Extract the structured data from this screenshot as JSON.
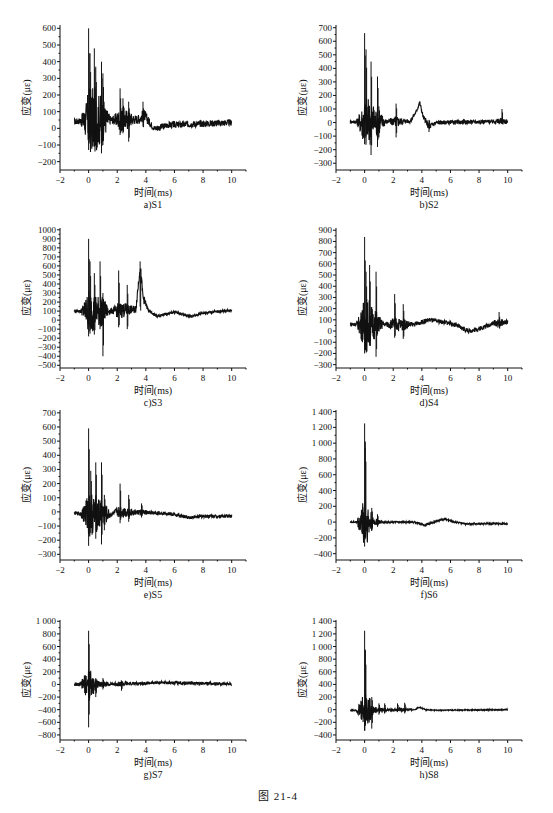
{
  "figure": {
    "title": "图   21-4"
  },
  "chart_data": [
    {
      "id": "a",
      "type": "line",
      "caption": "a)S1",
      "xlabel": "时间(ms)",
      "ylabel": "应变(με)",
      "xlim": [
        -2,
        11
      ],
      "xticks": [
        -2,
        0,
        2,
        4,
        6,
        8,
        10
      ],
      "ylim": [
        -250,
        620
      ],
      "yticks": [
        600,
        500,
        400,
        300,
        200,
        100,
        0,
        -100,
        -200
      ],
      "ytick_labels": [
        "600",
        "500",
        "400",
        "300",
        "200",
        "100",
        "0",
        "-100",
        "-200"
      ],
      "x_range": [
        -1,
        10
      ],
      "baseline_points": [
        [
          -1,
          40
        ],
        [
          0,
          50
        ],
        [
          1,
          50
        ],
        [
          3.5,
          55
        ],
        [
          3.9,
          80
        ],
        [
          4.3,
          30
        ],
        [
          4.6,
          0
        ],
        [
          5.0,
          5
        ],
        [
          5.5,
          20
        ],
        [
          10,
          35
        ]
      ],
      "noise": 20,
      "spikes": [
        [
          0.0,
          600,
          -130
        ],
        [
          0.1,
          450,
          -80
        ],
        [
          0.4,
          480,
          -110
        ],
        [
          0.5,
          370,
          -60
        ],
        [
          0.9,
          400,
          -150
        ],
        [
          1.0,
          330,
          -100
        ],
        [
          2.2,
          240,
          -40
        ],
        [
          2.4,
          180,
          -30
        ],
        [
          2.8,
          160,
          -80
        ],
        [
          3.8,
          160,
          10
        ]
      ],
      "box": {
        "left": 20,
        "top": 15,
        "width": 240,
        "height": 195
      },
      "grid": false
    },
    {
      "id": "b",
      "type": "line",
      "caption": "b)S2",
      "xlabel": "时间(ms)",
      "ylabel": "应变(με)",
      "xlim": [
        -2,
        11
      ],
      "xticks": [
        -2,
        0,
        2,
        4,
        6,
        8,
        10
      ],
      "ylim": [
        -350,
        720
      ],
      "yticks": [
        700,
        600,
        500,
        400,
        300,
        200,
        100,
        0,
        -100,
        -200,
        -300
      ],
      "ytick_labels": [
        "700",
        "600",
        "500",
        "400",
        "300",
        "200",
        "100",
        "0",
        "-100",
        "-200",
        "-300"
      ],
      "x_range": [
        -1,
        10
      ],
      "baseline_points": [
        [
          -1,
          5
        ],
        [
          3.2,
          10
        ],
        [
          3.6,
          80
        ],
        [
          3.85,
          150
        ],
        [
          4.1,
          40
        ],
        [
          4.5,
          -30
        ],
        [
          5.0,
          0
        ],
        [
          10,
          10
        ]
      ],
      "noise": 15,
      "spikes": [
        [
          0.0,
          660,
          -160
        ],
        [
          0.1,
          540,
          -100
        ],
        [
          0.45,
          450,
          -240
        ],
        [
          0.9,
          340,
          -180
        ],
        [
          1.0,
          120,
          -110
        ],
        [
          2.2,
          140,
          -110
        ],
        [
          4.5,
          20,
          -70
        ],
        [
          9.6,
          100,
          -10
        ]
      ],
      "box": {
        "left": 296,
        "top": 15,
        "width": 240,
        "height": 195
      },
      "grid": false
    },
    {
      "id": "c",
      "type": "line",
      "caption": "c)S3",
      "xlabel": "时间(ms)",
      "ylabel": "应变(με)",
      "xlim": [
        -2,
        11
      ],
      "xticks": [
        -2,
        0,
        2,
        4,
        6,
        8,
        10
      ],
      "ylim": [
        -530,
        1020
      ],
      "yticks": [
        1000,
        900,
        800,
        700,
        600,
        500,
        400,
        300,
        200,
        100,
        0,
        -100,
        -200,
        -300,
        -400,
        -500
      ],
      "ytick_labels": [
        "1000",
        "900",
        "800",
        "700",
        "600",
        "500",
        "400",
        "300",
        "200",
        "100",
        "0",
        "-100",
        "-200",
        "-300",
        "-400",
        "-500"
      ],
      "x_range": [
        -1,
        10
      ],
      "baseline_points": [
        [
          -1,
          100
        ],
        [
          1.5,
          100
        ],
        [
          3.3,
          120
        ],
        [
          3.6,
          600
        ],
        [
          3.8,
          250
        ],
        [
          4.2,
          100
        ],
        [
          4.8,
          40
        ],
        [
          6.0,
          90
        ],
        [
          7.2,
          40
        ],
        [
          8.0,
          80
        ],
        [
          10,
          110
        ]
      ],
      "noise": 15,
      "spikes": [
        [
          0.0,
          900,
          -180
        ],
        [
          0.1,
          650,
          -150
        ],
        [
          0.4,
          520,
          -160
        ],
        [
          0.8,
          650,
          -100
        ],
        [
          1.0,
          300,
          -400
        ],
        [
          2.1,
          550,
          -80
        ],
        [
          2.7,
          390,
          -100
        ],
        [
          3.6,
          650,
          150
        ]
      ],
      "box": {
        "left": 20,
        "top": 218,
        "width": 240,
        "height": 190
      },
      "grid": false
    },
    {
      "id": "d",
      "type": "line",
      "caption": "d)S4",
      "xlabel": "时间(ms)",
      "ylabel": "应变(με)",
      "xlim": [
        -2,
        11
      ],
      "xticks": [
        -2,
        0,
        2,
        4,
        6,
        8,
        10
      ],
      "ylim": [
        -330,
        920
      ],
      "yticks": [
        900,
        800,
        700,
        600,
        500,
        400,
        300,
        200,
        100,
        0,
        -100,
        -200,
        -300
      ],
      "ytick_labels": [
        "900",
        "800",
        "700",
        "600",
        "500",
        "400",
        "300",
        "200",
        "100",
        "0",
        "-100",
        "-200",
        "-300"
      ],
      "x_range": [
        -1,
        10
      ],
      "baseline_points": [
        [
          -1,
          60
        ],
        [
          3.5,
          60
        ],
        [
          4.5,
          100
        ],
        [
          6.0,
          70
        ],
        [
          7.3,
          0
        ],
        [
          8.0,
          20
        ],
        [
          9.0,
          70
        ],
        [
          10,
          80
        ]
      ],
      "noise": 20,
      "spikes": [
        [
          0.0,
          840,
          -200
        ],
        [
          0.1,
          530,
          -150
        ],
        [
          0.35,
          590,
          -130
        ],
        [
          0.8,
          530,
          -230
        ],
        [
          2.1,
          330,
          -60
        ],
        [
          2.7,
          240,
          -70
        ],
        [
          9.4,
          170,
          30
        ]
      ],
      "box": {
        "left": 296,
        "top": 218,
        "width": 240,
        "height": 190
      },
      "grid": false
    },
    {
      "id": "e",
      "type": "line",
      "caption": "e)S5",
      "xlabel": "时间(ms)",
      "ylabel": "应变(με)",
      "xlim": [
        -2,
        11
      ],
      "xticks": [
        -2,
        0,
        2,
        4,
        6,
        8,
        10
      ],
      "ylim": [
        -340,
        720
      ],
      "yticks": [
        700,
        600,
        500,
        400,
        300,
        200,
        100,
        0,
        -100,
        -200,
        -300
      ],
      "ytick_labels": [
        "700",
        "600",
        "500",
        "400",
        "300",
        "200",
        "100",
        "0",
        "-100",
        "-200",
        "-300"
      ],
      "x_range": [
        -1,
        10
      ],
      "baseline_points": [
        [
          -1,
          -10
        ],
        [
          1.5,
          -20
        ],
        [
          2.0,
          0
        ],
        [
          5.5,
          -10
        ],
        [
          7.0,
          -40
        ],
        [
          8.0,
          -30
        ],
        [
          10,
          -30
        ]
      ],
      "noise": 12,
      "spikes": [
        [
          0.0,
          590,
          -240
        ],
        [
          0.15,
          290,
          -150
        ],
        [
          0.5,
          350,
          -190
        ],
        [
          0.9,
          350,
          -230
        ],
        [
          1.1,
          120,
          -130
        ],
        [
          2.2,
          200,
          -80
        ],
        [
          2.8,
          120,
          -70
        ],
        [
          3.7,
          60,
          -40
        ]
      ],
      "box": {
        "left": 20,
        "top": 400,
        "width": 240,
        "height": 200
      },
      "grid": false
    },
    {
      "id": "f",
      "type": "line",
      "caption": "f)S6",
      "xlabel": "时间(ms)",
      "ylabel": "应变(με)",
      "xlim": [
        -2,
        11
      ],
      "xticks": [
        -2,
        0,
        2,
        4,
        6,
        8,
        10
      ],
      "ylim": [
        -480,
        1420
      ],
      "yticks": [
        1400,
        1200,
        1000,
        800,
        600,
        400,
        200,
        0,
        -200,
        -400
      ],
      "ytick_labels": [
        "1 400",
        "1 200",
        "1 000",
        "800",
        "600",
        "400",
        "200",
        "0",
        "-200",
        "-400"
      ],
      "x_range": [
        -1,
        10
      ],
      "baseline_points": [
        [
          -1,
          0
        ],
        [
          3.5,
          0
        ],
        [
          4.2,
          -40
        ],
        [
          5.0,
          10
        ],
        [
          5.6,
          40
        ],
        [
          6.3,
          0
        ],
        [
          7.0,
          -20
        ],
        [
          10,
          -20
        ]
      ],
      "noise": 10,
      "spikes": [
        [
          0.0,
          1250,
          -310
        ],
        [
          0.05,
          1020,
          -150
        ],
        [
          0.5,
          180,
          -100
        ],
        [
          0.9,
          100,
          -60
        ]
      ],
      "box": {
        "left": 296,
        "top": 400,
        "width": 240,
        "height": 200
      },
      "grid": false
    },
    {
      "id": "g",
      "type": "line",
      "caption": "g)S7",
      "xlabel": "时间(ms)",
      "ylabel": "应变(με)",
      "xlim": [
        -2,
        11
      ],
      "xticks": [
        -2,
        0,
        2,
        4,
        6,
        8,
        10
      ],
      "ylim": [
        -880,
        1020
      ],
      "yticks": [
        1000,
        800,
        600,
        400,
        200,
        0,
        -200,
        -400,
        -600,
        -800
      ],
      "ytick_labels": [
        "1 000",
        "800",
        "600",
        "400",
        "200",
        "0",
        "-200",
        "-400",
        "-600",
        "-800"
      ],
      "x_range": [
        -1,
        10
      ],
      "baseline_points": [
        [
          -1,
          0
        ],
        [
          3.0,
          10
        ],
        [
          5.0,
          30
        ],
        [
          7.0,
          20
        ],
        [
          10,
          10
        ]
      ],
      "noise": 25,
      "spikes": [
        [
          0.0,
          850,
          -680
        ],
        [
          0.05,
          200,
          -260
        ],
        [
          0.5,
          100,
          -200
        ],
        [
          1.0,
          100,
          -80
        ],
        [
          2.3,
          60,
          -100
        ]
      ],
      "box": {
        "left": 20,
        "top": 610,
        "width": 240,
        "height": 170
      },
      "grid": false
    },
    {
      "id": "h",
      "type": "line",
      "caption": "h)S8",
      "xlabel": "时间(ms)",
      "ylabel": "应变(με)",
      "xlim": [
        -2,
        11
      ],
      "xticks": [
        -2,
        0,
        2,
        4,
        6,
        8,
        10
      ],
      "ylim": [
        -480,
        1420
      ],
      "yticks": [
        1400,
        1200,
        1000,
        800,
        600,
        400,
        200,
        0,
        -200,
        -400
      ],
      "ytick_labels": [
        "1 400",
        "1 200",
        "1 000",
        "800",
        "600",
        "400",
        "200",
        "0",
        "-200",
        "-400"
      ],
      "x_range": [
        -1,
        10
      ],
      "baseline_points": [
        [
          -1,
          -10
        ],
        [
          3.5,
          0
        ],
        [
          3.8,
          40
        ],
        [
          4.3,
          0
        ],
        [
          5.0,
          -10
        ],
        [
          10,
          0
        ]
      ],
      "noise": 8,
      "spikes": [
        [
          0.0,
          1250,
          -330
        ],
        [
          0.05,
          950,
          -200
        ],
        [
          0.5,
          200,
          -300
        ],
        [
          1.0,
          100,
          -80
        ],
        [
          1.4,
          100,
          -60
        ],
        [
          2.3,
          100,
          -30
        ],
        [
          2.8,
          110,
          -60
        ]
      ],
      "box": {
        "left": 296,
        "top": 610,
        "width": 240,
        "height": 170
      },
      "grid": false
    }
  ]
}
